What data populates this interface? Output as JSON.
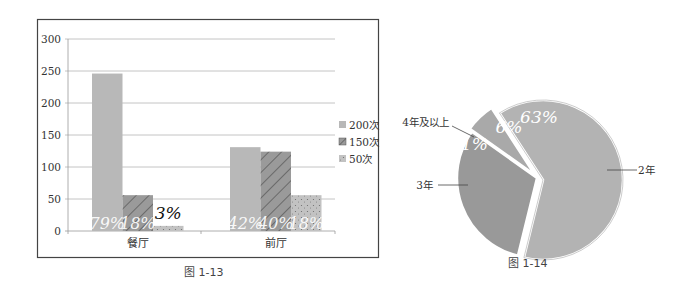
{
  "chart_data": [
    {
      "type": "bar",
      "caption": "图 1-13",
      "title": "",
      "xlabel": "",
      "ylabel": "",
      "categories": [
        "餐厅",
        "前厅"
      ],
      "series": [
        {
          "name": "200次",
          "values": [
            246,
            131
          ],
          "pct_labels": [
            "79%",
            "42%"
          ],
          "color": "#b8b8b8",
          "pattern": "solid"
        },
        {
          "name": "150次",
          "values": [
            56,
            124
          ],
          "pct_labels": [
            "18%",
            "40%"
          ],
          "color": "#9a9a9a",
          "pattern": "diagonal-hatch"
        },
        {
          "name": "50次",
          "values": [
            8,
            56
          ],
          "pct_labels": [
            "3%",
            "18%"
          ],
          "color": "#c2c2c2",
          "pattern": "dotted"
        }
      ],
      "yticks": [
        0,
        50,
        100,
        150,
        200,
        250,
        300
      ],
      "ylim": [
        0,
        300
      ],
      "grid": true,
      "legend_position": "right"
    },
    {
      "type": "pie",
      "caption": "图 1-14",
      "title": "",
      "slices": [
        {
          "label": "2年",
          "value": 63,
          "pct_label": "63%",
          "color": "#b3b3b3",
          "exploded": true
        },
        {
          "label": "3年",
          "value": 31,
          "pct_label": "31%",
          "color": "#999999",
          "exploded": false
        },
        {
          "label": "4年及以上",
          "value": 6,
          "pct_label": "6%",
          "color": "#a9a9a9",
          "exploded": true
        }
      ]
    }
  ]
}
